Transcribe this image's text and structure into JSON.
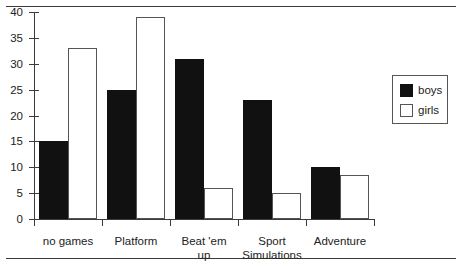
{
  "chart_data": {
    "type": "bar",
    "title": "",
    "xlabel": "",
    "ylabel": "",
    "ylim": [
      0,
      40
    ],
    "yticks": [
      0,
      5,
      10,
      15,
      20,
      25,
      30,
      35,
      40
    ],
    "grid": false,
    "legend_position": "right",
    "categories": [
      "no games",
      "Platform",
      "Beat 'em up",
      "Sport Simulations",
      "Adventure"
    ],
    "category_lines": [
      [
        "no games"
      ],
      [
        "Platform"
      ],
      [
        "Beat 'em",
        "up"
      ],
      [
        "Sport",
        "Simulations"
      ],
      [
        "Adventure"
      ]
    ],
    "series": [
      {
        "name": "boys",
        "color": "#111111",
        "values": [
          15,
          25,
          31,
          23,
          10
        ]
      },
      {
        "name": "girls",
        "color": "#ffffff",
        "values": [
          33,
          39,
          6,
          5,
          8.5
        ]
      }
    ]
  },
  "legend": {
    "items": [
      {
        "label": "boys"
      },
      {
        "label": "girls"
      }
    ]
  }
}
